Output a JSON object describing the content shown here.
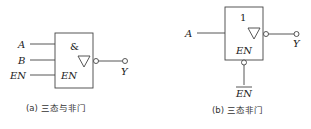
{
  "diagram_a": {
    "gate_symbol": "&",
    "inputs": [
      {
        "label": "A"
      },
      {
        "label": "B"
      },
      {
        "label": "EN"
      }
    ],
    "enable_pin_label": "EN",
    "output_label": "Y",
    "caption": "(a) 三态与非门"
  },
  "diagram_b": {
    "gate_symbol": "1",
    "inputs": [
      {
        "label": "A"
      }
    ],
    "enable_pin_label": "EN",
    "enable_input_label": "EN",
    "enable_active_low": true,
    "output_label": "Y",
    "caption": "(b) 三态非门"
  }
}
